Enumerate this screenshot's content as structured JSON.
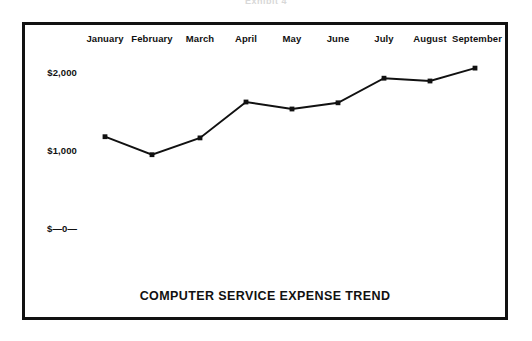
{
  "scan": {
    "header_fragment": "Exhibit 4"
  },
  "chart_data": {
    "type": "line",
    "title": "COMPUTER SERVICE EXPENSE TREND",
    "xlabel": "",
    "ylabel": "",
    "categories": [
      "January",
      "February",
      "March",
      "April",
      "May",
      "June",
      "July",
      "August",
      "September"
    ],
    "values": [
      1170,
      940,
      1155,
      1615,
      1525,
      1605,
      1920,
      1885,
      2050
    ],
    "ytick_labels": [
      "$2,000",
      "$1,000",
      "$—0—"
    ],
    "ytick_values": [
      2000,
      1000,
      0
    ],
    "ylim": [
      0,
      2200
    ],
    "grid": false,
    "legend": null,
    "series_color": "#111111",
    "marker": "square",
    "axis_labels_position": "top"
  }
}
